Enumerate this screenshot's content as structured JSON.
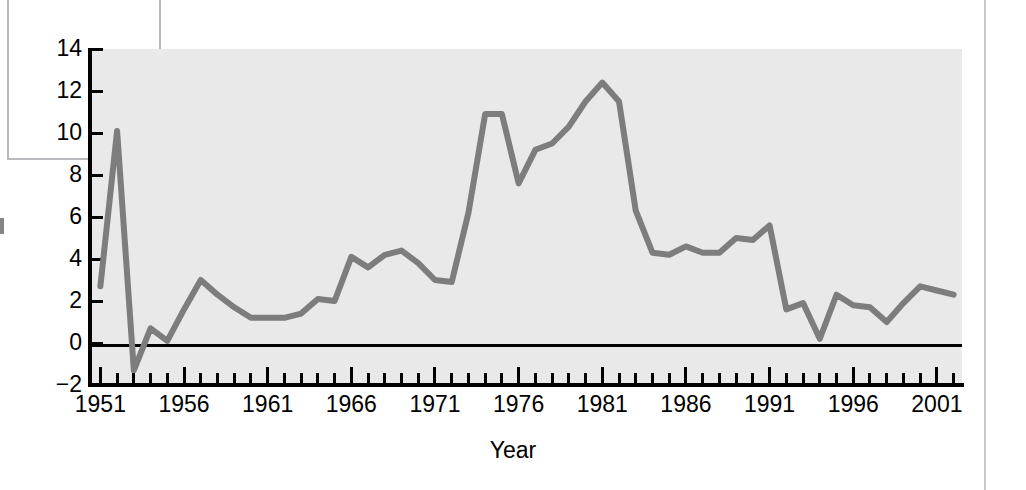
{
  "figure": {
    "background_color": "#ffffff",
    "plot_background_color": "#e9e9e9",
    "line_color": "#7d7d7d",
    "axis_color": "#000000"
  },
  "artifacts": {
    "page_border_color": "#c9c9cd",
    "clipped_y_axis_label_fragment": ""
  },
  "chart_data": {
    "type": "line",
    "title": "",
    "xlabel": "Year",
    "ylabel": "",
    "xlim": [
      1950.5,
      2002.5
    ],
    "ylim": [
      -2,
      14
    ],
    "grid": false,
    "legend": false,
    "y_ticks": [
      -2,
      0,
      2,
      4,
      6,
      8,
      10,
      12,
      14
    ],
    "y_tick_labels": [
      "−2",
      "0",
      "2",
      "4",
      "6",
      "8",
      "10",
      "12",
      "14"
    ],
    "x_tick_labels": [
      "1951",
      "1956",
      "1961",
      "1966",
      "1971",
      "1976",
      "1981",
      "1986",
      "1991",
      "1996",
      "2001"
    ],
    "x_major_ticks": [
      1951,
      1956,
      1961,
      1966,
      1971,
      1976,
      1981,
      1986,
      1991,
      1996,
      2001
    ],
    "x_minor_tick_step": 1,
    "x": [
      1951,
      1952,
      1953,
      1954,
      1955,
      1956,
      1957,
      1958,
      1959,
      1960,
      1961,
      1962,
      1963,
      1964,
      1965,
      1966,
      1967,
      1968,
      1969,
      1970,
      1971,
      1972,
      1973,
      1974,
      1975,
      1976,
      1977,
      1978,
      1979,
      1980,
      1981,
      1982,
      1983,
      1984,
      1985,
      1986,
      1987,
      1988,
      1989,
      1990,
      1991,
      1992,
      1993,
      1994,
      1995,
      1996,
      1997,
      1998,
      1999,
      2000,
      2001,
      2002
    ],
    "values": [
      2.7,
      10.1,
      -1.3,
      0.7,
      0.1,
      1.6,
      3.0,
      2.3,
      1.7,
      1.2,
      1.2,
      1.2,
      1.4,
      2.1,
      2.0,
      4.1,
      3.6,
      4.2,
      4.4,
      3.8,
      3.0,
      2.9,
      6.2,
      10.9,
      10.9,
      7.6,
      9.2,
      9.5,
      10.3,
      11.5,
      12.4,
      11.5,
      6.3,
      4.3,
      4.2,
      4.6,
      4.3,
      4.3,
      5.0,
      4.9,
      5.6,
      1.6,
      1.9,
      0.2,
      2.3,
      1.8,
      1.7,
      1.0,
      1.9,
      2.7,
      2.5,
      2.3
    ],
    "series_name": ""
  },
  "axis_title": {
    "x": "Year"
  }
}
